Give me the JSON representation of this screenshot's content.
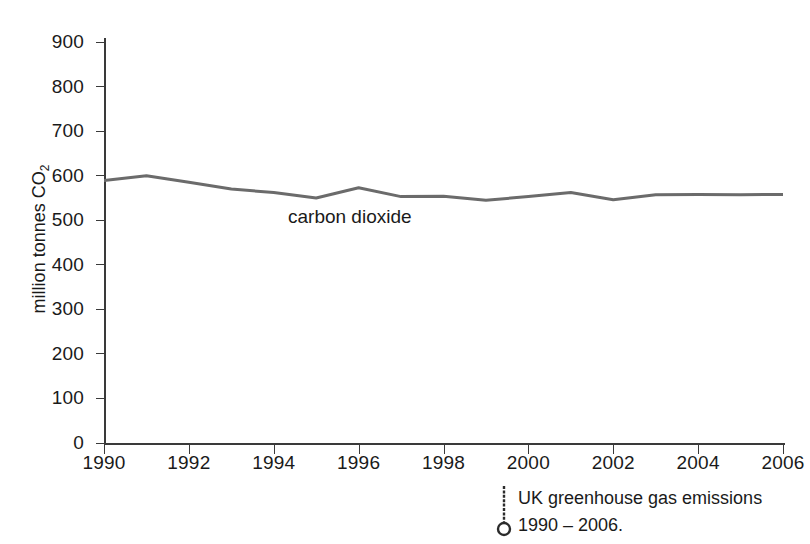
{
  "chart_data": {
    "type": "line",
    "title": "",
    "xlabel": "",
    "ylabel": "million tonnes CO2",
    "ylabel_parts": {
      "text": "million tonnes CO",
      "subscript": "2"
    },
    "xlim": [
      1990,
      2006
    ],
    "ylim": [
      0,
      900
    ],
    "y_ticks": [
      0,
      100,
      200,
      300,
      400,
      500,
      600,
      700,
      800,
      900
    ],
    "y_tick_labels": [
      "0",
      "100",
      "200",
      "300",
      "400",
      "500",
      "600",
      "700",
      "800",
      "900"
    ],
    "x_ticks": [
      1990,
      1992,
      1994,
      1996,
      1998,
      2000,
      2002,
      2004,
      2006
    ],
    "x_tick_labels": [
      "1990",
      "1992",
      "1994",
      "1996",
      "1998",
      "2000",
      "2002",
      "2004",
      "2006"
    ],
    "grid": false,
    "legend_position": "inline-annotation",
    "x": [
      1990,
      1991,
      1992,
      1993,
      1994,
      1995,
      1996,
      1997,
      1998,
      1999,
      2000,
      2001,
      2002,
      2003,
      2004,
      2005,
      2006
    ],
    "series": [
      {
        "name": "carbon dioxide",
        "annotation": "carbon dioxide",
        "color": "#6b6b6b",
        "values": [
          589,
          600,
          585,
          570,
          562,
          550,
          573,
          553,
          554,
          545,
          553,
          562,
          546,
          557,
          558,
          557,
          558
        ]
      }
    ]
  },
  "caption": {
    "marker": "pin-marker-icon",
    "line1": "UK greenhouse gas emissions",
    "line2": "1990 – 2006."
  },
  "colors": {
    "axis": "#3a3a3a",
    "line": "#6b6b6b",
    "text": "#1a1a1a",
    "background": "#ffffff"
  }
}
